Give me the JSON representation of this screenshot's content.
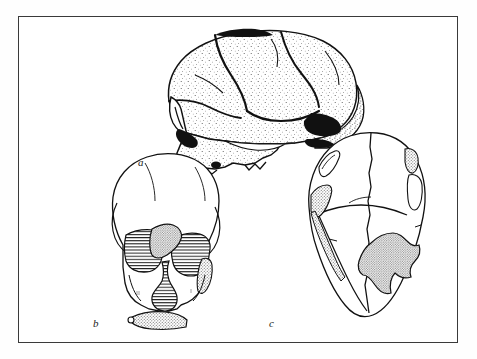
{
  "page": {
    "background_color": "#ffffff",
    "bleed_text_above": "",
    "frame": {
      "border_color": "#3a3a3a",
      "fill_color": "#ffffff",
      "x": 18,
      "y": 16,
      "width": 440,
      "height": 327
    }
  },
  "figure": {
    "kind": "scientific-illustration-plate",
    "ink_color": "#111111",
    "hatch_color": "#2b2b2b",
    "stipple_color": "#8e8e8e",
    "panels": [
      {
        "id": "a",
        "label": "a",
        "view": "lateral (left side) view of cranium",
        "label_x": 119,
        "label_y": 139,
        "description": "stippled pen-and-ink rendering of a cranium in left lateral view with heavy cranial suture lines, broken orbital margin, and dark shaded temporal and auditory openings"
      },
      {
        "id": "b",
        "label": "b",
        "view": "frontal (anterior) view of cranium",
        "label_x": 74,
        "label_y": 300,
        "shaded_regions": [
          {
            "name": "right-orbit-region",
            "fill": "horizontal-hatch"
          },
          {
            "name": "left-orbit-region",
            "fill": "horizontal-hatch"
          },
          {
            "name": "nasal-aperture",
            "fill": "horizontal-hatch"
          },
          {
            "name": "supraorbital-torus-fragment",
            "fill": "stipple"
          },
          {
            "name": "maxilla-alveolar-strip",
            "fill": "stipple"
          },
          {
            "name": "left-temporal-strip",
            "fill": "stipple"
          }
        ]
      },
      {
        "id": "c",
        "label": "c",
        "view": "superior (norma verticalis) view of cranium",
        "label_x": 250,
        "label_y": 300,
        "shaded_regions": [
          {
            "name": "right-parietal-defect",
            "fill": "stipple"
          },
          {
            "name": "left-lateral-defect",
            "fill": "stipple"
          },
          {
            "name": "frontal-notch",
            "fill": "stipple"
          }
        ]
      }
    ]
  }
}
